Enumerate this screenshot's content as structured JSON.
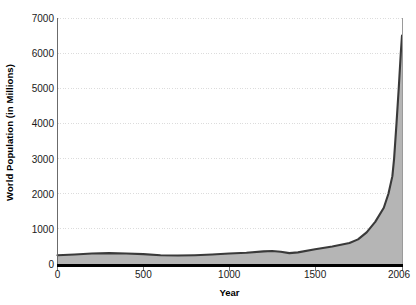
{
  "chart_data": {
    "type": "area",
    "title": "",
    "xlabel": "Year",
    "ylabel": "World Population (in Millions)",
    "xlim": [
      0,
      2006
    ],
    "ylim": [
      0,
      7000
    ],
    "grid": true,
    "legend": "none",
    "x_ticks": [
      0,
      500,
      1000,
      1500,
      2006
    ],
    "x_tick_labels": [
      "0",
      "500",
      "1000",
      "1500",
      "2006"
    ],
    "y_ticks": [
      0,
      1000,
      2000,
      3000,
      4000,
      5000,
      6000,
      7000
    ],
    "y_tick_labels": [
      "0",
      "1000",
      "2000",
      "3000",
      "4000",
      "5000",
      "6000",
      "7000"
    ],
    "series": [
      {
        "name": "World Population",
        "x": [
          0,
          100,
          200,
          300,
          400,
          500,
          600,
          700,
          800,
          900,
          1000,
          1100,
          1200,
          1250,
          1300,
          1350,
          1400,
          1500,
          1600,
          1700,
          1750,
          1800,
          1850,
          1900,
          1927,
          1950,
          1960,
          1974,
          1987,
          1999,
          2006
        ],
        "values": [
          250,
          270,
          300,
          310,
          300,
          280,
          250,
          240,
          250,
          270,
          300,
          320,
          360,
          370,
          350,
          310,
          330,
          420,
          500,
          600,
          700,
          900,
          1200,
          1600,
          2000,
          2500,
          3000,
          4000,
          5000,
          6000,
          6500
        ]
      }
    ],
    "colors": {
      "line": "#3a3a3a",
      "fill": "#b5b5b5",
      "axis": "#000000",
      "grid": "#dcdcdc",
      "background": "#ffffff",
      "tick_text": "#1a1a1a"
    }
  }
}
